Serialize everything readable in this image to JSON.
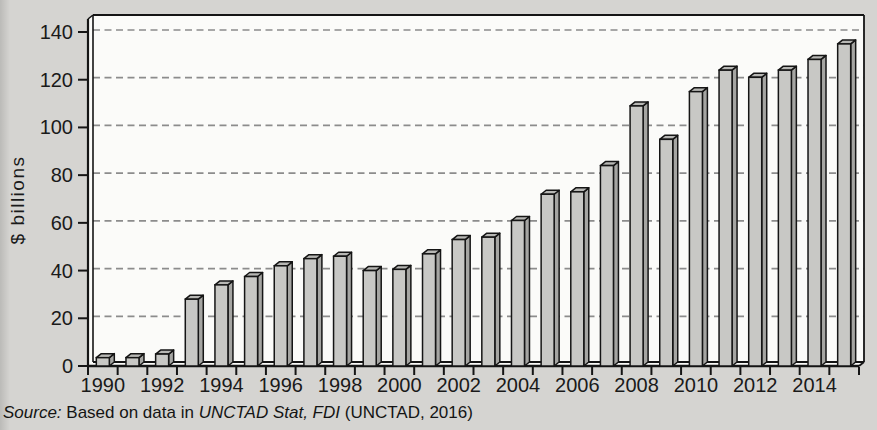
{
  "figure": {
    "kind": "scanned book figure, 3D-effect bar chart on grey page background"
  },
  "chart_data": {
    "type": "bar",
    "style": "3d-block-bars, light grey fill, black outline",
    "title": "",
    "xlabel": "",
    "ylabel": "$ billions",
    "categories": [
      "1990",
      "1991",
      "1992",
      "1993",
      "1994",
      "1995",
      "1996",
      "1997",
      "1998",
      "1999",
      "2000",
      "2001",
      "2002",
      "2003",
      "2004",
      "2005",
      "2006",
      "2007",
      "2008",
      "2009",
      "2010",
      "2011",
      "2012",
      "2013",
      "2014",
      "2015"
    ],
    "values": [
      3.5,
      3.5,
      5,
      28,
      34,
      37.5,
      42,
      45,
      46,
      40,
      40.5,
      47,
      53,
      54,
      61,
      72,
      73,
      84,
      109,
      95,
      115,
      124,
      121,
      124,
      128.5,
      135
    ],
    "ylim": [
      0,
      145
    ],
    "yticks": [
      0,
      20,
      40,
      60,
      80,
      100,
      120,
      140
    ],
    "x_label_every": 2,
    "grid": "horizontal dashed grey lines at each y tick (20-140)",
    "legend": "none",
    "colors": {
      "page_background": "#d5d4d1",
      "plot_background": "#fbfbf9",
      "bar_front": "#c8c8c5",
      "bar_top": "#b7b7b4",
      "bar_side": "#a5a5a2",
      "outline": "#151515",
      "gridline": "#8c8c8c",
      "text": "#1a1a1a"
    }
  },
  "source": {
    "label": "Source: ",
    "text_before": "Based on data in ",
    "cited_work": "UNCTAD Stat, FDI",
    "text_after": " (UNCTAD, 2016)"
  }
}
